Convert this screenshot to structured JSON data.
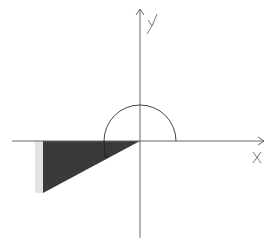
{
  "diagram": {
    "type": "coordinate-plane-sketch",
    "axes": {
      "x_label": "X",
      "y_label": "Y",
      "origin": [
        140,
        141
      ],
      "x_range_px": [
        12,
        265
      ],
      "y_range_px": [
        8,
        238
      ]
    },
    "semicircle": {
      "center": [
        140,
        141
      ],
      "radius": 36,
      "orientation": "upper-half"
    },
    "shaded_triangle": {
      "vertices": [
        [
          140,
          141
        ],
        [
          43,
          141
        ],
        [
          43,
          193
        ]
      ],
      "fill": "#3a3a3a",
      "edge_highlight": "#d6d6d6"
    },
    "arrow_arc": {
      "from": [
        104,
        141
      ],
      "to": [
        106,
        157
      ],
      "description": "rotation arrow from negative x-axis into shaded region"
    },
    "colors": {
      "background": "#ffffff",
      "line": "#555555",
      "fill": "#3a3a3a"
    }
  }
}
